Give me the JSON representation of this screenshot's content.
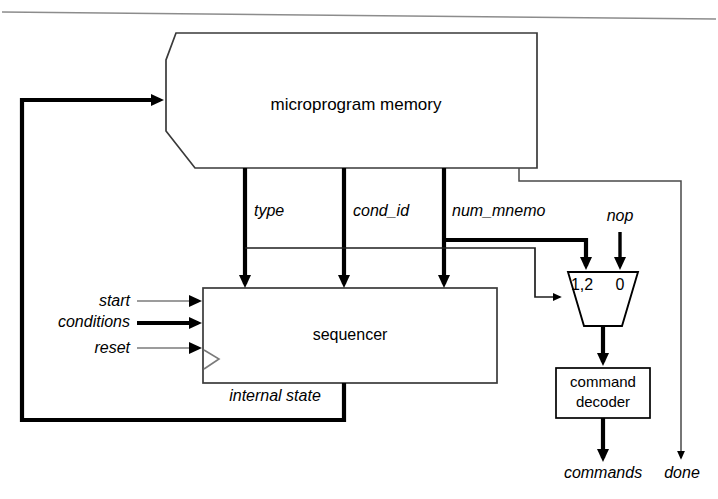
{
  "diagram": {
    "blocks": {
      "memory": {
        "label": "microprogram memory",
        "shape": "memory-octagon"
      },
      "sequencer": {
        "label": "sequencer",
        "shape": "rectangle"
      },
      "mux": {
        "label_left": "1,2",
        "label_right": "0",
        "shape": "trapezoid-multiplexer"
      },
      "decoder": {
        "label_line1": "command",
        "label_line2": "decoder",
        "shape": "rectangle"
      }
    },
    "signals": {
      "type": "type",
      "cond_id": "cond_id",
      "num_mnemo": "num_mnemo",
      "nop": "nop",
      "start": "start",
      "conditions": "conditions",
      "reset": "reset",
      "internal_state": "internal state",
      "commands": "commands",
      "done": "done"
    },
    "colors": {
      "stroke": "#000000",
      "thin_stroke": "#555555",
      "background": "#ffffff"
    }
  }
}
